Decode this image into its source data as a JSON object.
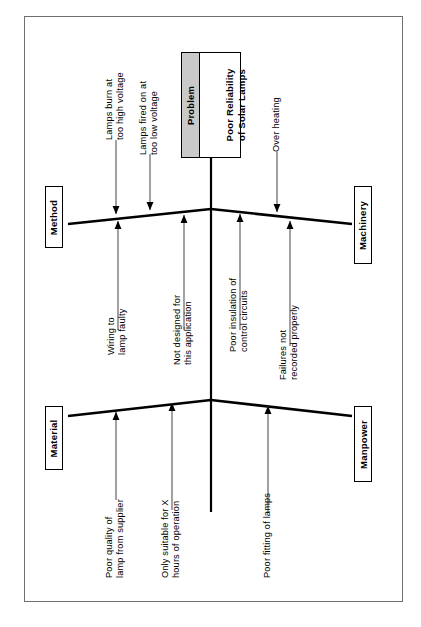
{
  "diagram": {
    "type": "fishbone-ishikawa",
    "orientation": "rotated-90-counterclockwise",
    "problem": {
      "header_label": "Problem",
      "effect_line1": "Poor Reliability",
      "effect_line2": "of Solar Lamps"
    },
    "categories": [
      {
        "id": "method",
        "label": "Method",
        "position": "top-left",
        "causes": [
          {
            "id": "method-cause-1",
            "line1": "Lamps burn at",
            "line2": "too high voltage"
          },
          {
            "id": "method-cause-2",
            "line1": "Lamps fired on at",
            "line2": "too low voltage"
          }
        ]
      },
      {
        "id": "machinery",
        "label": "Machinery",
        "position": "top-right",
        "causes": [
          {
            "id": "machinery-cause-1",
            "line1": "Over heating",
            "line2": ""
          }
        ]
      },
      {
        "id": "material",
        "label": "Material",
        "position": "bottom-left",
        "causes": [
          {
            "id": "material-cause-1",
            "line1": "Wiring to",
            "line2": "lamp faulty"
          },
          {
            "id": "material-cause-2",
            "line1": "Not designed for",
            "line2": "this application"
          },
          {
            "id": "material-cause-3",
            "line1": "Poor quality of",
            "line2": "lamp from supplier"
          },
          {
            "id": "material-cause-4",
            "line1": "Only suitable for X",
            "line2": "hours of operation"
          }
        ]
      },
      {
        "id": "manpower",
        "label": "Manpower",
        "position": "bottom-right",
        "causes": [
          {
            "id": "manpower-cause-1",
            "line1": "Poor insulation of",
            "line2": "control circuits"
          },
          {
            "id": "manpower-cause-2",
            "line1": "Failures not",
            "line2": "recorded properly"
          },
          {
            "id": "manpower-cause-3",
            "line1": "Poor fitting of lamps",
            "line2": ""
          }
        ]
      }
    ],
    "colors": {
      "line": "#000000",
      "frame_border": "#6f6f6f",
      "problem_header_fill": "#c9c9c9",
      "background": "#ffffff"
    }
  }
}
